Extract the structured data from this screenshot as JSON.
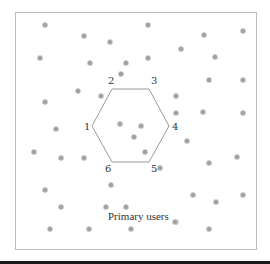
{
  "diagram": {
    "caption": "Primary users",
    "vertex_labels": [
      "1",
      "2",
      "3",
      "4",
      "5",
      "6"
    ],
    "frame": {
      "x": 15,
      "y": 12,
      "w": 241,
      "h": 237
    },
    "hexagon": [
      [
        92,
        126
      ],
      [
        112,
        89
      ],
      [
        149,
        89
      ],
      [
        169,
        126
      ],
      [
        149,
        162
      ],
      [
        112,
        162
      ]
    ],
    "label_positions": [
      [
        84,
        130
      ],
      [
        108,
        84
      ],
      [
        151,
        84
      ],
      [
        172,
        130
      ],
      [
        151,
        172
      ],
      [
        105,
        172
      ]
    ],
    "caption_position": [
      108,
      220
    ],
    "dots": [
      [
        45,
        25
      ],
      [
        84,
        36
      ],
      [
        110,
        42
      ],
      [
        148,
        25
      ],
      [
        204,
        35
      ],
      [
        243,
        31
      ],
      [
        40,
        58
      ],
      [
        90,
        63
      ],
      [
        126,
        63
      ],
      [
        148,
        58
      ],
      [
        181,
        49
      ],
      [
        215,
        57
      ],
      [
        78,
        91
      ],
      [
        101,
        96
      ],
      [
        176,
        96
      ],
      [
        209,
        80
      ],
      [
        243,
        80
      ],
      [
        45,
        102
      ],
      [
        121,
        74
      ],
      [
        176,
        113
      ],
      [
        203,
        112
      ],
      [
        243,
        113
      ],
      [
        56,
        129
      ],
      [
        120,
        124
      ],
      [
        141,
        126
      ],
      [
        134,
        137
      ],
      [
        145,
        152
      ],
      [
        34,
        152
      ],
      [
        61,
        158
      ],
      [
        84,
        158
      ],
      [
        187,
        141
      ],
      [
        209,
        163
      ],
      [
        237,
        157
      ],
      [
        111,
        185
      ],
      [
        160,
        168
      ],
      [
        193,
        195
      ],
      [
        216,
        202
      ],
      [
        243,
        195
      ],
      [
        45,
        190
      ],
      [
        61,
        207
      ],
      [
        106,
        207
      ],
      [
        126,
        207
      ],
      [
        176,
        222
      ],
      [
        50,
        229
      ],
      [
        89,
        229
      ],
      [
        131,
        229
      ],
      [
        209,
        229
      ],
      [
        175,
        222
      ]
    ],
    "colors": {
      "dot": "#a0a0a0",
      "frame": "#bdbdbd",
      "hexagon": "#9a9a9a",
      "text": "#333333"
    }
  }
}
